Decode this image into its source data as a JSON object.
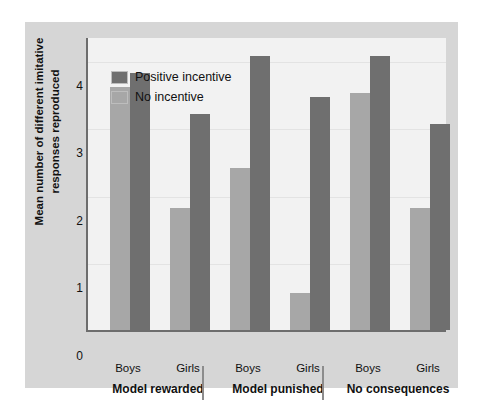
{
  "chart_data": {
    "type": "bar",
    "title": "",
    "xlabel": "",
    "ylabel": "Mean number of different imitative responses reproduced",
    "ylim": [
      0,
      4.35
    ],
    "yticks": [
      0,
      1,
      2,
      3,
      4
    ],
    "ytick_labels": [
      "0",
      "1",
      "2",
      "3",
      "4"
    ],
    "grid": true,
    "legend_position": "top-left",
    "groups": [
      {
        "label": "Model rewarded",
        "subgroups": [
          {
            "label": "Boys",
            "no_incentive": 3.6,
            "positive_incentive": 3.8
          },
          {
            "label": "Girls",
            "no_incentive": 1.8,
            "positive_incentive": 3.2
          }
        ]
      },
      {
        "label": "Model punished",
        "subgroups": [
          {
            "label": "Boys",
            "no_incentive": 2.4,
            "positive_incentive": 4.05
          },
          {
            "label": "Girls",
            "no_incentive": 0.55,
            "positive_incentive": 3.45
          }
        ]
      },
      {
        "label": "No consequences",
        "subgroups": [
          {
            "label": "Boys",
            "no_incentive": 3.5,
            "positive_incentive": 4.05
          },
          {
            "label": "Girls",
            "no_incentive": 1.8,
            "positive_incentive": 3.05
          }
        ]
      }
    ],
    "categories": [
      "Model rewarded - Boys",
      "Model rewarded - Girls",
      "Model punished - Boys",
      "Model punished - Girls",
      "No consequences - Boys",
      "No consequences - Girls"
    ],
    "series": [
      {
        "name": "No incentive",
        "color": "#a7a7a7",
        "values": [
          3.6,
          1.8,
          2.4,
          0.55,
          3.5,
          1.8
        ]
      },
      {
        "name": "Positive incentive",
        "color": "#6f6f6f",
        "values": [
          3.8,
          3.2,
          4.05,
          3.45,
          4.05,
          3.05
        ]
      }
    ]
  },
  "legend": {
    "items": [
      {
        "label": "Positive incentive",
        "color": "#6f6f6f"
      },
      {
        "label": "No incentive",
        "color": "#a7a7a7"
      }
    ]
  },
  "axis": {
    "y_title": "Mean number of different imitative responses reproduced",
    "y_tick_labels": [
      "4",
      "3",
      "2",
      "1",
      "0"
    ]
  },
  "x_axis": {
    "sub_labels": [
      "Boys",
      "Girls",
      "Boys",
      "Girls",
      "Boys",
      "Girls"
    ],
    "group_labels": [
      "Model rewarded",
      "Model punished",
      "No consequences"
    ]
  },
  "colors": {
    "panel_background": "#d6d6d6",
    "plot_background": "#f2f2f2",
    "axis_line": "#6d6d6d",
    "bar_dark": "#6f6f6f",
    "bar_light": "#a7a7a7",
    "gridline": "#e3e3e3",
    "separator": "#8c8c8c",
    "text": "#111111"
  }
}
